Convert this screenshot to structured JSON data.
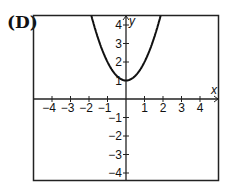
{
  "label": "(D)",
  "chart_data": {
    "type": "line",
    "title": "",
    "xlabel": "x",
    "ylabel": "y",
    "xlim": [
      -5,
      5
    ],
    "ylim": [
      -5,
      4.5
    ],
    "xticks": [
      -4,
      -3,
      -2,
      -1,
      1,
      2,
      3,
      4
    ],
    "yticks": [
      -4,
      -3,
      -2,
      -1,
      1,
      2,
      3,
      4
    ],
    "grid": false,
    "series": [
      {
        "name": "y = x^2 + 1",
        "equation": "y = x^2 + 1",
        "vertex": [
          0,
          1
        ],
        "x": [
          -1.9,
          -1.5,
          -1,
          -0.5,
          0,
          0.5,
          1,
          1.5,
          1.9
        ],
        "y": [
          4.61,
          3.25,
          2,
          1.25,
          1,
          1.25,
          2,
          3.25,
          4.61
        ]
      }
    ]
  }
}
